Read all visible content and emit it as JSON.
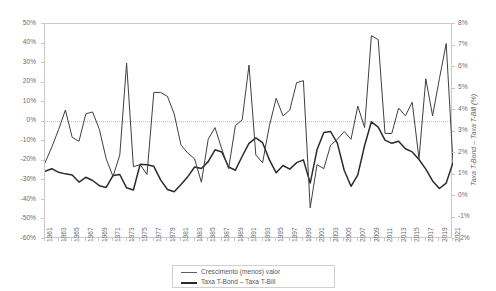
{
  "chart_data": {
    "type": "line",
    "title": "",
    "xlabel": "",
    "ylabel": "",
    "y2label": "Taxa T-Bond – Taxa T-Bill (%)",
    "grid": false,
    "zero_line": true,
    "legend_position": "bottom",
    "ylim": [
      -0.6,
      0.5
    ],
    "y2lim": [
      -0.02,
      0.08
    ],
    "ytick_labels": [
      "50%",
      "40%",
      "30%",
      "20%",
      "10%",
      "0%",
      "-10%",
      "-20%",
      "-30%",
      "-40%",
      "-50%",
      "-60%"
    ],
    "ytick_values": [
      0.5,
      0.4,
      0.3,
      0.2,
      0.1,
      0.0,
      -0.1,
      -0.2,
      -0.3,
      -0.4,
      -0.5,
      -0.6
    ],
    "y2tick_labels": [
      "8%",
      "7%",
      "6%",
      "5%",
      "4%",
      "3%",
      "2%",
      "1%",
      "0%",
      "-1%",
      "-2%"
    ],
    "y2tick_values": [
      0.08,
      0.07,
      0.06,
      0.05,
      0.04,
      0.03,
      0.02,
      0.01,
      0.0,
      -0.01,
      -0.02
    ],
    "x": [
      1961,
      1962,
      1963,
      1964,
      1965,
      1966,
      1967,
      1968,
      1969,
      1970,
      1971,
      1972,
      1973,
      1974,
      1975,
      1976,
      1977,
      1978,
      1979,
      1980,
      1981,
      1982,
      1983,
      1984,
      1985,
      1986,
      1987,
      1988,
      1989,
      1990,
      1991,
      1992,
      1993,
      1994,
      1995,
      1996,
      1997,
      1998,
      1999,
      2000,
      2001,
      2002,
      2003,
      2004,
      2005,
      2006,
      2007,
      2008,
      2009,
      2010,
      2011,
      2012,
      2013,
      2014,
      2015,
      2016,
      2017,
      2018,
      2019,
      2020,
      2021
    ],
    "xtick_labels": [
      "1961",
      "1963",
      "1965",
      "1967",
      "1969",
      "1971",
      "1973",
      "1975",
      "1977",
      "1979",
      "1981",
      "1983",
      "1985",
      "1987",
      "1989",
      "1991",
      "1993",
      "1995",
      "1997",
      "1999",
      "2001",
      "2003",
      "2005",
      "2007",
      "2009",
      "2011",
      "2013",
      "2015",
      "2017",
      "2019",
      "2021"
    ],
    "series": [
      {
        "name": "Crescimento (menos) valor",
        "axis": "left",
        "color": "#3f3f3f",
        "values": [
          -0.21,
          -0.13,
          -0.04,
          0.06,
          -0.08,
          -0.1,
          0.04,
          0.05,
          -0.04,
          -0.19,
          -0.28,
          -0.17,
          0.3,
          -0.23,
          -0.22,
          -0.27,
          0.15,
          0.15,
          0.13,
          0.04,
          -0.12,
          -0.16,
          -0.19,
          -0.31,
          -0.09,
          -0.03,
          -0.14,
          -0.24,
          -0.02,
          0.01,
          0.29,
          -0.17,
          -0.21,
          -0.02,
          0.12,
          0.03,
          0.06,
          0.2,
          0.21,
          -0.44,
          -0.22,
          -0.24,
          -0.12,
          -0.09,
          -0.05,
          -0.09,
          0.08,
          -0.03,
          0.44,
          0.42,
          -0.06,
          -0.06,
          0.07,
          0.03,
          0.1,
          -0.19,
          0.22,
          0.03,
          0.22,
          0.4,
          -0.21
        ]
      },
      {
        "name": "Taxa T-Bond – Taxa T-Bill",
        "axis": "right",
        "color": "#2b2b2b",
        "values": [
          0.0115,
          0.0127,
          0.011,
          0.0103,
          0.0098,
          0.0065,
          0.0087,
          0.0072,
          0.0048,
          0.004,
          0.0095,
          0.01,
          0.0038,
          0.0028,
          0.0148,
          0.0145,
          0.0138,
          0.0075,
          0.003,
          0.002,
          0.0053,
          0.009,
          0.0135,
          0.0128,
          0.016,
          0.0215,
          0.0205,
          0.0135,
          0.012,
          0.0185,
          0.0245,
          0.027,
          0.0248,
          0.0168,
          0.0108,
          0.0142,
          0.0125,
          0.0155,
          0.0168,
          0.006,
          0.0215,
          0.0295,
          0.03,
          0.0245,
          0.012,
          0.0045,
          0.0098,
          0.0235,
          0.0345,
          0.032,
          0.026,
          0.0245,
          0.0255,
          0.022,
          0.0205,
          0.017,
          0.0125,
          0.007,
          0.0035,
          0.006,
          0.0155
        ]
      }
    ]
  },
  "axis": {
    "right_title": "Taxa T-Bond – Taxa T-Bill (%)"
  },
  "legend": {
    "items": [
      {
        "label": "Crescimento (menos) valor",
        "color": "#5a5a5a",
        "width": "1.4px"
      },
      {
        "label": "Taxa T-Bond – Taxa T-Bill",
        "color": "#2b2b2b",
        "width": "2.2px"
      }
    ]
  }
}
